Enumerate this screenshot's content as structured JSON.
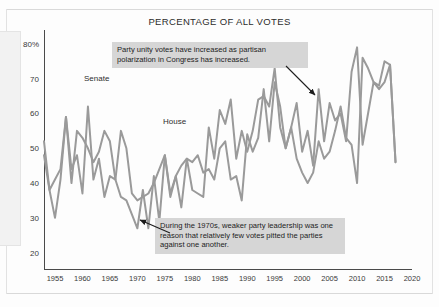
{
  "chart_data": {
    "type": "line",
    "title": "PERCENTAGE OF ALL VOTES",
    "xlabel": "",
    "ylabel": "",
    "xlim": [
      1953,
      2020
    ],
    "ylim": [
      15,
      84
    ],
    "grid": false,
    "legend": "inline-labels",
    "xticks": [
      "1955",
      "1960",
      "1965",
      "1970",
      "1975",
      "1980",
      "1985",
      "1990",
      "1995",
      "2000",
      "2005",
      "2010",
      "2015",
      "2020"
    ],
    "xtick_values": [
      1955,
      1960,
      1965,
      1970,
      1975,
      1980,
      1985,
      1990,
      1995,
      2000,
      2005,
      2010,
      2015,
      2020
    ],
    "yticks": [
      "80%",
      "70",
      "60",
      "50",
      "40",
      "30",
      "20"
    ],
    "ytick_values": [
      80,
      70,
      60,
      50,
      40,
      30,
      20
    ],
    "series": [
      {
        "name": "Senate",
        "color": "#9a9a9a",
        "x": [
          1953,
          1954,
          1955,
          1956,
          1957,
          1958,
          1959,
          1960,
          1961,
          1962,
          1963,
          1964,
          1965,
          1966,
          1967,
          1968,
          1969,
          1970,
          1971,
          1972,
          1973,
          1974,
          1975,
          1976,
          1977,
          1978,
          1979,
          1980,
          1981,
          1982,
          1983,
          1984,
          1985,
          1986,
          1987,
          1988,
          1989,
          1990,
          1991,
          1992,
          1993,
          1994,
          1995,
          1996,
          1997,
          1998,
          1999,
          2000,
          2001,
          2002,
          2003,
          2004,
          2005,
          2006,
          2007,
          2008,
          2009,
          2010,
          2011,
          2012,
          2013,
          2014,
          2015,
          2016,
          2017
        ],
        "values": [
          48,
          38,
          30,
          41,
          59,
          44,
          48,
          37,
          62,
          41,
          47,
          36,
          42,
          41,
          55,
          50,
          37,
          35,
          36,
          37,
          40,
          44,
          48,
          37,
          42,
          45,
          47,
          46,
          48,
          43,
          44,
          41,
          50,
          52,
          41,
          42,
          35,
          54,
          49,
          53,
          67,
          52,
          69,
          62,
          50,
          56,
          63,
          49,
          55,
          45,
          67,
          52,
          63,
          58,
          60,
          52,
          72,
          79,
          51,
          60,
          69,
          67,
          69,
          74,
          46
        ]
      },
      {
        "name": "House",
        "color": "#9a9a9a",
        "x": [
          1953,
          1954,
          1955,
          1956,
          1957,
          1958,
          1959,
          1960,
          1961,
          1962,
          1963,
          1964,
          1965,
          1966,
          1967,
          1968,
          1969,
          1970,
          1971,
          1972,
          1973,
          1974,
          1975,
          1976,
          1977,
          1978,
          1979,
          1980,
          1981,
          1982,
          1983,
          1984,
          1985,
          1986,
          1987,
          1988,
          1989,
          1990,
          1991,
          1992,
          1993,
          1994,
          1995,
          1996,
          1997,
          1998,
          1999,
          2000,
          2001,
          2002,
          2003,
          2004,
          2005,
          2006,
          2007,
          2008,
          2009,
          2010,
          2011,
          2012,
          2013,
          2014,
          2015,
          2016,
          2017
        ],
        "values": [
          52,
          38,
          41,
          44,
          59,
          40,
          55,
          53,
          50,
          46,
          49,
          55,
          52,
          41,
          36,
          35,
          31,
          27,
          38,
          27,
          42,
          29,
          48,
          36,
          42,
          33,
          47,
          38,
          37,
          36,
          56,
          47,
          61,
          57,
          64,
          47,
          55,
          49,
          55,
          64,
          65,
          62,
          73,
          56,
          50,
          56,
          47,
          43,
          40,
          43,
          52,
          47,
          49,
          55,
          62,
          53,
          51,
          40,
          76,
          73,
          69,
          68,
          75,
          74,
          46
        ]
      }
    ],
    "annotations": [
      {
        "name": "note-increase",
        "text": "Party unity votes have increased as partisan polarization in Congress has increased.",
        "arrow_to_year": 2003
      },
      {
        "name": "note-1970s",
        "text": "During the 1970s, weaker party leadership was one reason that relatively few votes pitted the parties against one another.",
        "arrow_to_year": 1972
      }
    ]
  },
  "colors": {
    "line": "#9a9a9a",
    "note_background": "#d6d6d6",
    "axis": "#4a4a4a",
    "text": "#2c2c2c"
  }
}
